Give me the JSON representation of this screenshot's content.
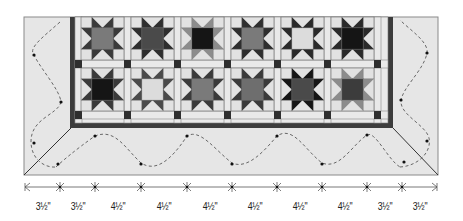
{
  "diagram": {
    "type": "quilt-layout-diagram",
    "grid": {
      "rows": 2,
      "columns": 6
    },
    "blocks": [
      {
        "row": 1,
        "col": 1,
        "center": "#7a7a7a",
        "points": "#3a3a3a"
      },
      {
        "row": 1,
        "col": 2,
        "center": "#4a4a4a",
        "points": "#2e2e2e"
      },
      {
        "row": 1,
        "col": 3,
        "center": "#151515",
        "points": "#8c8c8c"
      },
      {
        "row": 1,
        "col": 4,
        "center": "#7a7a7a",
        "points": "#2e2e2e"
      },
      {
        "row": 1,
        "col": 5,
        "center": "#dcdcdc",
        "points": "#2a2a2a"
      },
      {
        "row": 1,
        "col": 6,
        "center": "#151515",
        "points": "#2a2a2a"
      },
      {
        "row": 2,
        "col": 1,
        "center": "#151515",
        "points": "#3a3a3a"
      },
      {
        "row": 2,
        "col": 2,
        "center": "#dcdcdc",
        "points": "#4a4a4a"
      },
      {
        "row": 2,
        "col": 3,
        "center": "#7a7a7a",
        "points": "#3a3a3a"
      },
      {
        "row": 2,
        "col": 4,
        "center": "#6e6e6e",
        "points": "#3a3a3a"
      },
      {
        "row": 2,
        "col": 5,
        "center": "#4a4a4a",
        "points": "#151515"
      },
      {
        "row": 2,
        "col": 6,
        "center": "#3c3c3c",
        "points": "#8c8c8c"
      }
    ],
    "colors": {
      "background": "#ffffff",
      "outer_border": "#e6e6e6",
      "block_background": "#e2e2e2",
      "sashing": "#e9e9e9",
      "cornerstone": "#2e2e2e",
      "inner_border": "#3c3c3c",
      "line": "#555555"
    },
    "dimensions": {
      "labels": [
        "3½\"",
        "3½\"",
        "4½\"",
        "4½\"",
        "4½\"",
        "4½\"",
        "4½\"",
        "4½\"",
        "3½\"",
        "3½\""
      ],
      "tick_x": [
        25,
        60,
        95,
        141,
        187,
        232,
        277,
        322,
        367,
        402,
        437
      ]
    }
  }
}
